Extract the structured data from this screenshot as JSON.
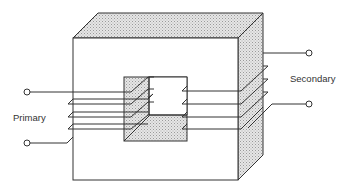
{
  "diagram": {
    "type": "transformer-schematic",
    "labels": {
      "primary": "Primary",
      "secondary": "Secondary"
    },
    "components": {
      "core": "laminated iron core (3D block with rectangular window)",
      "primary_winding": {
        "turns": 4,
        "side": "left limb",
        "terminals": 2
      },
      "secondary_winding": {
        "turns": 4,
        "side": "right limb",
        "terminals": 2
      }
    },
    "colors": {
      "line": "#333333",
      "shaded_face": "#d9d9d9",
      "background": "#ffffff"
    }
  }
}
